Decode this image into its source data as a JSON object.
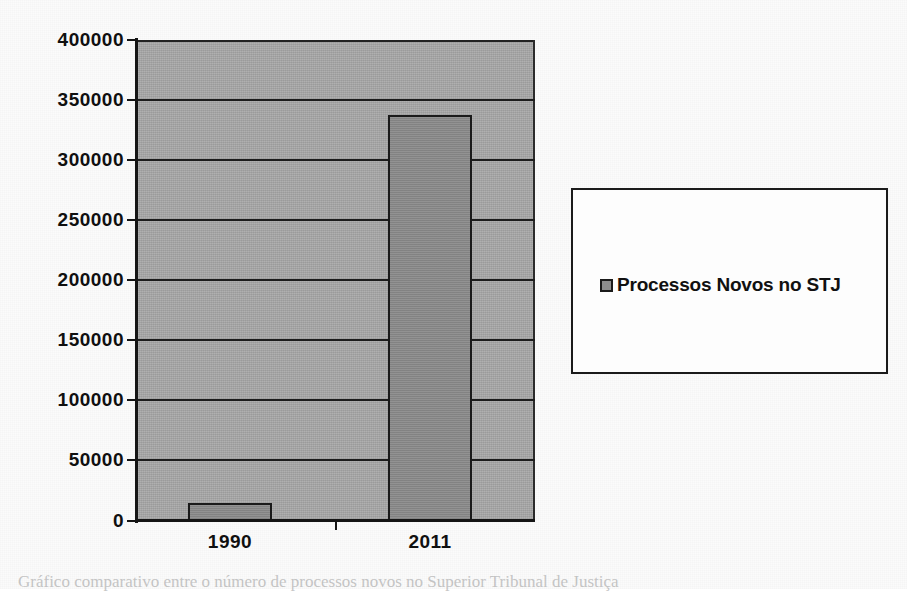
{
  "chart_data": {
    "type": "bar",
    "title": "",
    "xlabel": "",
    "ylabel": "",
    "categories": [
      "1990",
      "2011"
    ],
    "values": [
      15000,
      338000
    ],
    "series": [
      {
        "name": "Processos Novos no STJ",
        "values": [
          15000,
          338000
        ]
      }
    ],
    "ylim": [
      0,
      400000
    ],
    "ytick_step": 50000,
    "yticks": [
      {
        "value": 400000,
        "label": "400000"
      },
      {
        "value": 350000,
        "label": "350000"
      },
      {
        "value": 300000,
        "label": "300000"
      },
      {
        "value": 250000,
        "label": "250000"
      },
      {
        "value": 200000,
        "label": "200000"
      },
      {
        "value": 150000,
        "label": "150000"
      },
      {
        "value": 100000,
        "label": "100000"
      },
      {
        "value": 50000,
        "label": "50000"
      },
      {
        "value": 0,
        "label": "0"
      }
    ],
    "grid": true,
    "grid_axis": "y",
    "legend": {
      "position": "right",
      "entries": [
        {
          "label": "Processos Novos no STJ",
          "marker": "legend-swatch-icon"
        }
      ]
    },
    "colors": {
      "bar_fill": "#8c8c8c",
      "bar_border": "#1a1a1a",
      "plot_background": "#a9a9a9",
      "gridline": "#1c1c1c",
      "axis": "#151515",
      "text": "#101010",
      "legend_background": "#fdfdfd",
      "legend_border": "#1b1b1b"
    }
  },
  "caption": {
    "text": "Gráfico comparativo entre o número de processos novos no Superior Tribunal de Justiça"
  }
}
